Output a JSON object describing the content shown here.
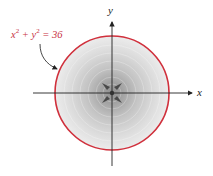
{
  "figure": {
    "equation": {
      "lhs_x": "x",
      "lhs_y": "y",
      "exp": "2",
      "plus": "+",
      "equals": "=",
      "rhs": "36",
      "color": "#c8323f"
    },
    "axes": {
      "x_label": "x",
      "y_label": "y"
    },
    "circle": {
      "center": [
        0,
        0
      ],
      "radius": 6,
      "stroke": "#d0303c"
    },
    "shading": "radial gray gradient, darker toward center",
    "center_marker": "four arrowheads pointing inward toward origin"
  }
}
